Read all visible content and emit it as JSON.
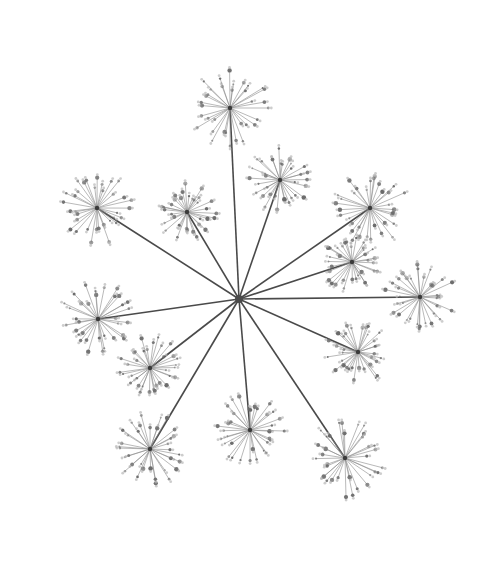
{
  "image": {
    "subject": "umbel flower head (top view)",
    "background_color": "#ffffff",
    "stem_color": "#4a4a4a",
    "floret_color": "#6a6a6a",
    "hub": {
      "x": 239,
      "y": 299
    },
    "umbellets": [
      {
        "x": 230,
        "y": 108,
        "r": 40
      },
      {
        "x": 280,
        "y": 180,
        "r": 32
      },
      {
        "x": 187,
        "y": 212,
        "r": 30
      },
      {
        "x": 97,
        "y": 208,
        "r": 38
      },
      {
        "x": 370,
        "y": 208,
        "r": 38
      },
      {
        "x": 352,
        "y": 262,
        "r": 30
      },
      {
        "x": 420,
        "y": 297,
        "r": 36
      },
      {
        "x": 98,
        "y": 319,
        "r": 38
      },
      {
        "x": 150,
        "y": 368,
        "r": 32
      },
      {
        "x": 358,
        "y": 352,
        "r": 32
      },
      {
        "x": 150,
        "y": 449,
        "r": 38
      },
      {
        "x": 250,
        "y": 430,
        "r": 36
      },
      {
        "x": 345,
        "y": 458,
        "r": 40
      }
    ]
  }
}
